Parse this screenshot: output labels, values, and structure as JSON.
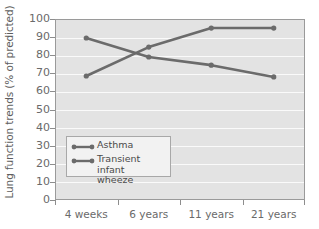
{
  "chart_data": {
    "type": "line",
    "title": "",
    "xlabel": "",
    "ylabel": "Lung function trends (% of predicted)",
    "categories": [
      "4 weeks",
      "6 years",
      "11 years",
      "21 years"
    ],
    "ylim": [
      0,
      100
    ],
    "ytick_step": 10,
    "yticks": [
      100,
      90,
      80,
      70,
      60,
      50,
      40,
      30,
      20,
      10,
      0
    ],
    "grid": true,
    "legend_position": "inside-lower-left",
    "series": [
      {
        "name": "Asthma",
        "values": [
          68.5,
          84.5,
          95.0,
          95.0
        ],
        "color": "#6b6b6b",
        "marker": "circle"
      },
      {
        "name": "Transient infant\nwheeze",
        "values": [
          89.5,
          79.0,
          74.5,
          68.0
        ],
        "color": "#6b6b6b",
        "marker": "circle"
      }
    ],
    "legend_entries": [
      "Asthma",
      "Transient infant\nwheeze"
    ],
    "colors": {
      "plot_background": "#e3e3e3",
      "gridline": "#fafafa",
      "series_line": "#6b6b6b",
      "axis": "#9a9a9a",
      "text": "#6a6a6a",
      "legend_background": "#f2f2f2"
    }
  }
}
